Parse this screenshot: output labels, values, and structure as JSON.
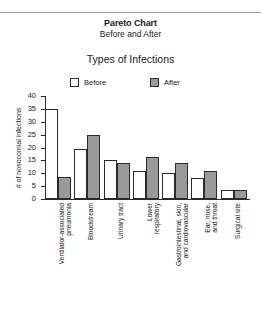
{
  "chart_data": {
    "type": "bar",
    "title": "Pareto Chart",
    "subtitle": "Before and After",
    "plot_heading": "Types of Infections",
    "xlabel": "",
    "ylabel": "# of nosocomial infections",
    "ylim": [
      0,
      40
    ],
    "ytick_labels": [
      "40",
      "35",
      "30",
      "25",
      "20",
      "15",
      "10",
      "5",
      "0"
    ],
    "yticks": [
      40,
      35,
      30,
      25,
      20,
      15,
      10,
      5,
      0
    ],
    "grid": false,
    "legend_position": "top",
    "categories": [
      "Ventilator-associated\npneumonia",
      "Bloodstream",
      "Urinary tract",
      "Lower\nrespiratory",
      "Gastrointestinal, skin,\nand cardiovascular",
      "Ear, nose,\nand throat",
      "Surgical site"
    ],
    "series": [
      {
        "name": "Before",
        "values": [
          35,
          19.5,
          15.2,
          11,
          10,
          8,
          3.5
        ]
      },
      {
        "name": "After",
        "values": [
          8.5,
          25,
          14.1,
          16.2,
          14,
          10.7,
          3.5
        ]
      }
    ]
  },
  "colors": {
    "before_fill": "#ffffff",
    "after_fill": "#9a9a9a",
    "axis": "#2b2b2b",
    "text": "#1a1a1a",
    "rule": "#9a9a9a"
  }
}
